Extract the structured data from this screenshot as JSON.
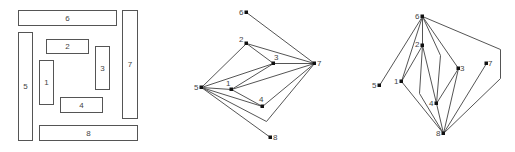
{
  "panels": {
    "layout": {
      "rects": [
        {
          "id": "6",
          "x": 18,
          "y": 10,
          "w": 98,
          "h": 15
        },
        {
          "id": "5",
          "x": 18,
          "y": 32,
          "w": 14,
          "h": 108
        },
        {
          "id": "2",
          "x": 46,
          "y": 39,
          "w": 42,
          "h": 14
        },
        {
          "id": "1",
          "x": 39,
          "y": 60,
          "w": 14,
          "h": 44
        },
        {
          "id": "3",
          "x": 95,
          "y": 46,
          "w": 14,
          "h": 43
        },
        {
          "id": "7",
          "x": 122,
          "y": 10,
          "w": 15,
          "h": 108
        },
        {
          "id": "4",
          "x": 60,
          "y": 97,
          "w": 42,
          "h": 15
        },
        {
          "id": "8",
          "x": 39,
          "y": 125,
          "w": 98,
          "h": 15
        }
      ]
    },
    "graph_a": {
      "nodes": [
        {
          "id": "6",
          "x": 246,
          "y": 12,
          "lx": -7,
          "ly": 3
        },
        {
          "id": "2",
          "x": 246,
          "y": 43,
          "lx": -7,
          "ly": -1
        },
        {
          "id": "3",
          "x": 273,
          "y": 63,
          "lx": 1,
          "ly": -3
        },
        {
          "id": "7",
          "x": 314,
          "y": 63,
          "lx": 3,
          "ly": 3
        },
        {
          "id": "5",
          "x": 201,
          "y": 87,
          "lx": -7,
          "ly": 3
        },
        {
          "id": "1",
          "x": 231,
          "y": 89,
          "lx": -5,
          "ly": -3
        },
        {
          "id": "4",
          "x": 262,
          "y": 106,
          "lx": -3,
          "ly": -4
        },
        {
          "id": "8",
          "x": 270,
          "y": 137,
          "lx": 3,
          "ly": 3
        }
      ],
      "edges": [
        [
          [
            246,
            12
          ],
          [
            314,
            63
          ]
        ],
        [
          [
            246,
            43
          ],
          [
            314,
            63
          ]
        ],
        [
          [
            246,
            43
          ],
          [
            273,
            63
          ]
        ],
        [
          [
            246,
            43
          ],
          [
            201,
            87
          ]
        ],
        [
          [
            273,
            63
          ],
          [
            314,
            63
          ]
        ],
        [
          [
            273,
            63
          ],
          [
            201,
            87
          ]
        ],
        [
          [
            273,
            63
          ],
          [
            231,
            89
          ]
        ],
        [
          [
            231,
            89
          ],
          [
            314,
            63
          ]
        ],
        [
          [
            201,
            87
          ],
          [
            231,
            89
          ]
        ],
        [
          [
            231,
            89
          ],
          [
            262,
            106
          ]
        ],
        [
          [
            201,
            87
          ],
          [
            262,
            106
          ]
        ],
        [
          [
            262,
            106
          ],
          [
            314,
            63
          ]
        ],
        [
          [
            201,
            87
          ],
          [
            266,
            121
          ],
          [
            314,
            63
          ]
        ],
        [
          [
            201,
            87
          ],
          [
            270,
            137
          ]
        ]
      ]
    },
    "graph_b": {
      "nodes": [
        {
          "id": "6",
          "x": 422,
          "y": 16,
          "lx": -7,
          "ly": 3
        },
        {
          "id": "2",
          "x": 422,
          "y": 45,
          "lx": -7,
          "ly": 2
        },
        {
          "id": "1",
          "x": 401,
          "y": 81,
          "lx": -7,
          "ly": 3
        },
        {
          "id": "5",
          "x": 379,
          "y": 85,
          "lx": -7,
          "ly": 3
        },
        {
          "id": "3",
          "x": 458,
          "y": 68,
          "lx": 2,
          "ly": 3
        },
        {
          "id": "7",
          "x": 486,
          "y": 63,
          "lx": 2,
          "ly": 3
        },
        {
          "id": "4",
          "x": 436,
          "y": 103,
          "lx": -7,
          "ly": 3
        },
        {
          "id": "8",
          "x": 443,
          "y": 133,
          "lx": -7,
          "ly": 3
        }
      ],
      "edges": [
        [
          [
            422,
            16
          ],
          [
            379,
            85
          ]
        ],
        [
          [
            422,
            16
          ],
          [
            401,
            81
          ]
        ],
        [
          [
            422,
            16
          ],
          [
            422,
            45
          ]
        ],
        [
          [
            422,
            16
          ],
          [
            440,
            55
          ],
          [
            436,
            103
          ]
        ],
        [
          [
            422,
            16
          ],
          [
            458,
            68
          ]
        ],
        [
          [
            422,
            16
          ],
          [
            500,
            49
          ],
          [
            500,
            78
          ],
          [
            443,
            133
          ]
        ],
        [
          [
            422,
            45
          ],
          [
            401,
            81
          ]
        ],
        [
          [
            422,
            45
          ],
          [
            436,
            103
          ]
        ],
        [
          [
            422,
            45
          ],
          [
            419,
            93
          ],
          [
            443,
            133
          ]
        ],
        [
          [
            401,
            81
          ],
          [
            443,
            133
          ]
        ],
        [
          [
            436,
            103
          ],
          [
            458,
            68
          ]
        ],
        [
          [
            436,
            103
          ],
          [
            443,
            133
          ]
        ],
        [
          [
            458,
            68
          ],
          [
            443,
            133
          ]
        ],
        [
          [
            486,
            63
          ],
          [
            443,
            133
          ]
        ]
      ]
    }
  }
}
